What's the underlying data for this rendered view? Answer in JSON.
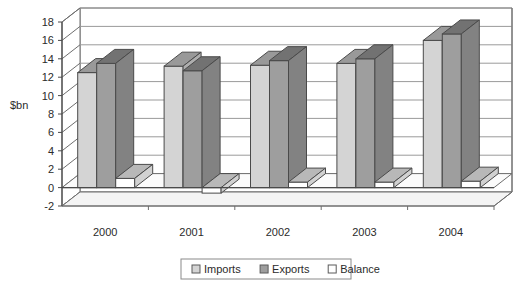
{
  "chart_data": {
    "type": "bar",
    "title": "",
    "subtitle": "",
    "xlabel": "",
    "ylabel": "$bn",
    "categories": [
      "2000",
      "2001",
      "2002",
      "2003",
      "2004"
    ],
    "series": [
      {
        "name": "Imports",
        "values": [
          12.5,
          13.2,
          13.3,
          13.5,
          16.0
        ],
        "color": "#d4d4d4"
      },
      {
        "name": "Exports",
        "values": [
          13.5,
          12.7,
          13.8,
          14.0,
          16.7
        ],
        "color": "#9e9e9e"
      },
      {
        "name": "Balance",
        "values": [
          1.0,
          -0.6,
          0.6,
          0.6,
          0.7
        ],
        "color": "#ffffff"
      }
    ],
    "ylim": [
      -2,
      18
    ],
    "yticks": [
      -2,
      0,
      2,
      4,
      6,
      8,
      10,
      12,
      14,
      16,
      18
    ],
    "ytick_labels": [
      "-2",
      "0",
      "2",
      "4",
      "6",
      "8",
      "10",
      "12",
      "14",
      "16",
      "18"
    ],
    "grid": true,
    "grid_axis": "y",
    "legend_position": "bottom",
    "style": "3d-column",
    "plot_bgcolor": "#ffffff",
    "grid_color": "#999999",
    "axis_color": "#4a4a4a"
  },
  "legend": {
    "items": [
      {
        "label": "Imports",
        "swatch": "#d4d4d4"
      },
      {
        "label": "Exports",
        "swatch": "#9e9e9e"
      },
      {
        "label": "Balance",
        "swatch": "#ffffff"
      }
    ]
  }
}
